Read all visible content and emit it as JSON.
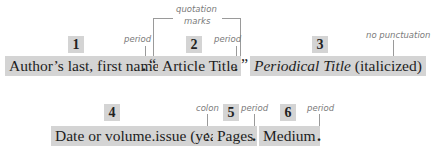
{
  "row1": {
    "segments": [
      {
        "number": "1",
        "text": "Author’s last, first name"
      },
      {
        "number": "2",
        "text": "Article Title"
      },
      {
        "number": "3",
        "text_italic": "Periodical Title",
        "text_plain": " (italicized)"
      }
    ],
    "punctuation": {
      "after_author": ".",
      "open_quote": "“",
      "after_title": ".",
      "close_quote": "”"
    },
    "annotations": {
      "period_1": "period",
      "quotation_marks_line1": "quotation",
      "quotation_marks_line2": "marks",
      "period_2": "period",
      "no_punctuation": "no punctuation"
    }
  },
  "row2": {
    "segments": [
      {
        "number": "4",
        "text": "Date or volume.issue (year)"
      },
      {
        "number": "5",
        "text": "Pages"
      },
      {
        "number": "6",
        "text": "Medium"
      }
    ],
    "punctuation": {
      "colon": ":",
      "after_pages": ".",
      "after_medium": "."
    },
    "annotations": {
      "colon": "colon",
      "period_1": "period",
      "period_2": "period"
    }
  },
  "colors": {
    "highlight": "#d4d4d4",
    "annotation_text": "#7a7a7a",
    "leader_line": "#9a9a9a"
  }
}
